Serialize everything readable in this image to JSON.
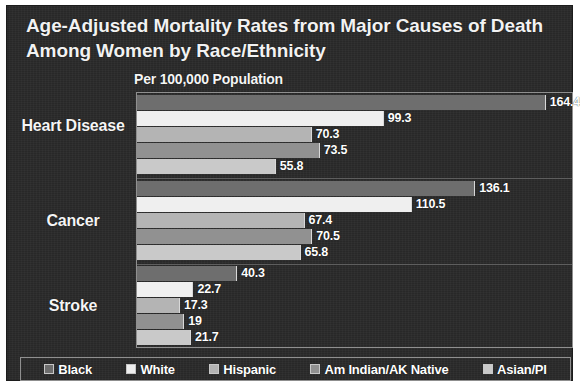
{
  "chart_data": {
    "type": "bar",
    "orientation": "horizontal",
    "title": "Age-Adjusted Mortality Rates from Major Causes of Death Among Women by Race/Ethnicity",
    "subtitle": "Per 100,000 Population",
    "xlabel": "",
    "ylabel": "",
    "xlim": [
      0,
      175
    ],
    "grid": false,
    "legend_position": "bottom",
    "categories": [
      "Heart Disease",
      "Cancer",
      "Stroke"
    ],
    "series": [
      {
        "name": "Black",
        "values": [
          164.4,
          136.1,
          40.3
        ],
        "color": "#6e6e6e"
      },
      {
        "name": "White",
        "values": [
          99.3,
          110.5,
          22.7
        ],
        "color": "#efefef"
      },
      {
        "name": "Hispanic",
        "values": [
          70.3,
          67.4,
          17.3
        ],
        "color": "#b4b4b4"
      },
      {
        "name": "Am Indian/AK Native",
        "values": [
          73.5,
          70.5,
          19
        ],
        "color": "#919191"
      },
      {
        "name": "Asian/PI",
        "values": [
          55.8,
          65.8,
          21.7
        ],
        "color": "#c9c9c9"
      }
    ],
    "value_labels": {
      "Heart Disease": [
        "164.4",
        "99.3",
        "70.3",
        "73.5",
        "55.8"
      ],
      "Cancer": [
        "136.1",
        "110.5",
        "67.4",
        "70.5",
        "65.8"
      ],
      "Stroke": [
        "40.3",
        "22.7",
        "17.3",
        "19",
        "21.7"
      ]
    }
  },
  "legend": {
    "items": [
      {
        "label": "Black"
      },
      {
        "label": "White"
      },
      {
        "label": "Hispanic"
      },
      {
        "label": "Am Indian/AK Native"
      },
      {
        "label": "Asian/PI"
      }
    ]
  },
  "theme": {
    "panel_background": "#2a2a2a",
    "text_color": "#f5f5f5",
    "frame_color": "#8f8f8f"
  }
}
